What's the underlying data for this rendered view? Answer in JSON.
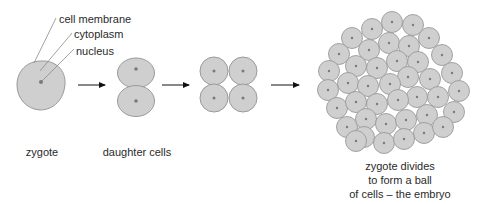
{
  "diagram": {
    "colors": {
      "cell_fill": "#cfcfcf",
      "cell_stroke": "#9a9a9a",
      "nucleus": "#7a7a7a",
      "arrow": "#111111",
      "leader_line": "#8a8a8a",
      "text": "#2a2a2a"
    },
    "part_labels": [
      {
        "id": "cell-membrane",
        "text": "cell membrane",
        "x": 59,
        "y": 14
      },
      {
        "id": "cytoplasm",
        "text": "cytoplasm",
        "x": 74,
        "y": 29
      },
      {
        "id": "nucleus",
        "text": "nucleus",
        "x": 76,
        "y": 46
      }
    ],
    "stages": [
      {
        "id": "zygote",
        "caption": "zygote"
      },
      {
        "id": "daughter-cells",
        "caption": "daughter cells"
      },
      {
        "id": "four-cells",
        "caption": ""
      },
      {
        "id": "embryo",
        "caption_lines": [
          "zygote divides",
          "to form a ball",
          "of cells – the embryo"
        ]
      }
    ],
    "arrows": [
      {
        "x1": 78,
        "x2": 106,
        "y": 85
      },
      {
        "x1": 162,
        "x2": 190,
        "y": 85
      },
      {
        "x1": 271,
        "x2": 300,
        "y": 85
      }
    ],
    "cell_counts": {
      "zygote": 1,
      "daughter_cells": 2,
      "four_cell_stage": 4,
      "embryo": 41
    }
  }
}
